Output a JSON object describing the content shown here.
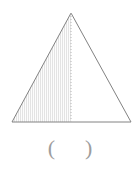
{
  "figure": {
    "type": "geometry-diagram",
    "shape": "triangle",
    "canvas": {
      "width": 140,
      "height": 169
    },
    "triangle": {
      "apex": {
        "x": 71,
        "y": 13
      },
      "base_left": {
        "x": 12,
        "y": 122
      },
      "base_right": {
        "x": 131,
        "y": 122
      },
      "outline_color": "#808080",
      "outline_width": 1
    },
    "median": {
      "from": {
        "x": 71,
        "y": 13
      },
      "to": {
        "x": 71,
        "y": 122
      },
      "style": "dashed",
      "color": "#b5b5b5",
      "dash": "1 2"
    },
    "shaded_region": {
      "side": "left",
      "pattern": "vertical-hatch",
      "pattern_spacing": 2,
      "pattern_color": "#e2e2e2",
      "fill_color": "#fbfbfb"
    }
  },
  "answer": {
    "open_paren": "(",
    "close_paren": ")",
    "value": "",
    "color": "#9d9d9d"
  }
}
